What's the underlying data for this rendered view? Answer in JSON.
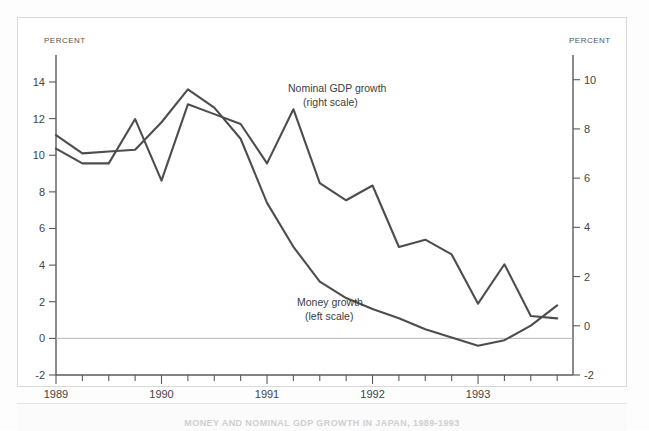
{
  "figure": {
    "caption": "MONEY AND NOMINAL GDP GROWTH IN JAPAN, 1989-1993"
  },
  "chart_data": {
    "type": "line",
    "title": "",
    "xlabel": "",
    "ylabel": "PERCENT",
    "left_axis": {
      "label": "PERCENT",
      "ticks": [
        14,
        12,
        10,
        8,
        6,
        4,
        2,
        0,
        -2
      ],
      "tick_labels": [
        "14",
        "12",
        "10",
        "8",
        "6",
        "4",
        "2",
        "0",
        "-2"
      ],
      "ylim": [
        -2,
        15.2
      ],
      "assigned_series": "Money growth"
    },
    "right_axis": {
      "label": "PERCENT",
      "ticks": [
        10,
        8,
        6,
        4,
        2,
        0,
        -2
      ],
      "tick_labels": [
        "10",
        "8",
        "6",
        "4",
        "2",
        "0",
        "-2"
      ],
      "ylim": [
        -2,
        10.8
      ],
      "assigned_series": "Nominal GDP growth"
    },
    "x": [
      "1989Q1",
      "1989Q2",
      "1989Q3",
      "1989Q4",
      "1990Q1",
      "1990Q2",
      "1990Q3",
      "1990Q4",
      "1991Q1",
      "1991Q2",
      "1991Q3",
      "1991Q4",
      "1992Q1",
      "1992Q2",
      "1992Q3",
      "1992Q4",
      "1993Q1",
      "1993Q2",
      "1993Q3",
      "1993Q4"
    ],
    "year_ticks": [
      "1989",
      "1990",
      "1991",
      "1992",
      "1993"
    ],
    "grid": false,
    "legend_position": "inline-annotations",
    "series": [
      {
        "name": "Money growth",
        "scale": "left",
        "annotation": "Money growth",
        "annotation_sub": "(left scale)",
        "color": "#4d4d4d",
        "values": [
          11.1,
          10.1,
          10.2,
          10.3,
          11.8,
          13.6,
          12.6,
          10.9,
          7.4,
          5.0,
          3.1,
          2.2,
          1.6,
          1.1,
          0.5,
          0.05,
          -0.4,
          -0.1,
          0.7,
          1.8
        ]
      },
      {
        "name": "Nominal GDP growth",
        "scale": "right",
        "annotation": "Nominal GDP growth",
        "annotation_sub": "(right scale)",
        "color": "#4d4d4d",
        "values": [
          7.2,
          6.6,
          6.6,
          8.4,
          5.9,
          9.0,
          8.6,
          8.2,
          6.6,
          8.8,
          5.8,
          5.1,
          5.7,
          3.2,
          3.5,
          2.9,
          0.9,
          2.5,
          0.4,
          0.3
        ]
      }
    ],
    "annotations": [
      {
        "id": "gdp-annotation",
        "line1": "Nominal GDP growth",
        "line2": "(right scale)"
      },
      {
        "id": "money-annotation",
        "line1": "Money growth",
        "line2": "(left scale)"
      }
    ]
  }
}
